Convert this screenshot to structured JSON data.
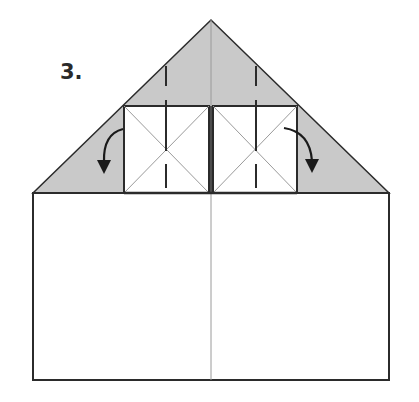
{
  "step": {
    "label": "3."
  },
  "colors": {
    "paper_back": "#c9c9c9",
    "paper_front": "#ffffff",
    "edge": "#2b2b2b",
    "crease": "#9a9a9a",
    "arrow": "#1a1a1a"
  },
  "shapes": {
    "roof_triangle": {
      "apex": [
        211,
        20
      ],
      "left": [
        33,
        193
      ],
      "right": [
        389,
        193
      ],
      "fill": "gray"
    },
    "base_rectangle": {
      "x": 33,
      "y": 193,
      "width": 356,
      "height": 187
    },
    "center_crease_x": 211,
    "flaps": [
      {
        "name": "left-square-flap",
        "x": 124,
        "y": 106,
        "width": 85,
        "height": 87,
        "fold_direction": "left-down"
      },
      {
        "name": "right-square-flap",
        "x": 213,
        "y": 106,
        "width": 84,
        "height": 87,
        "fold_direction": "right-down"
      }
    ]
  },
  "annotations": {
    "arrows": [
      {
        "name": "fold-arrow-left",
        "from": [
          123,
          129
        ],
        "to": [
          103,
          172
        ]
      },
      {
        "name": "fold-arrow-right",
        "from": [
          284,
          128
        ],
        "to": [
          312,
          171
        ]
      }
    ],
    "valley_fold_lines": [
      {
        "x": 166,
        "segments": [
          [
            66,
            86
          ],
          [
            100,
            151
          ],
          [
            164,
            188
          ]
        ]
      },
      {
        "x": 256,
        "segments": [
          [
            66,
            86
          ],
          [
            100,
            151
          ],
          [
            164,
            188
          ]
        ]
      }
    ]
  }
}
